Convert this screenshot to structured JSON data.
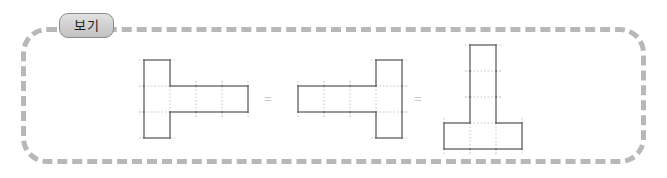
{
  "frame": {
    "border_color": "#b8b8b8",
    "border_style": "dashed",
    "corner_radius_px": 26
  },
  "tag": {
    "label": "보기",
    "fill_color": "#d2d2d2",
    "border_color": "#8c8c8c",
    "text_color": "#1b1b1b"
  },
  "figures": [
    {
      "name": "hexomino-net-left",
      "description": "vertical bar of three squares with horizontal bar of three squares extending right from the middle square",
      "cell_px": 26,
      "outline_color": "#6b6b6b",
      "grid_color": "#c9c9c9",
      "cells": [
        [
          0,
          0
        ],
        [
          0,
          1
        ],
        [
          0,
          2
        ],
        [
          1,
          1
        ],
        [
          2,
          1
        ],
        [
          3,
          1
        ]
      ],
      "cols": 4,
      "rows": 3
    },
    {
      "name": "hexomino-net-middle",
      "description": "horizontal bar of three squares with vertical bar of three squares on the right end, mirrored form",
      "cell_px": 26,
      "outline_color": "#6b6b6b",
      "grid_color": "#c9c9c9",
      "cells": [
        [
          0,
          1
        ],
        [
          1,
          1
        ],
        [
          2,
          1
        ],
        [
          3,
          0
        ],
        [
          3,
          1
        ],
        [
          3,
          2
        ]
      ],
      "cols": 4,
      "rows": 3
    },
    {
      "name": "hexomino-net-right",
      "description": "vertical bar of three squares on top with horizontal bar of three squares at the bottom, rotated form",
      "cell_px": 26,
      "outline_color": "#6b6b6b",
      "grid_color": "#c9c9c9",
      "cells": [
        [
          1,
          0
        ],
        [
          1,
          1
        ],
        [
          1,
          2
        ],
        [
          0,
          3
        ],
        [
          1,
          3
        ],
        [
          2,
          3
        ]
      ],
      "cols": 3,
      "rows": 4
    }
  ],
  "operators": [
    {
      "name": "equals-sign-1",
      "symbol": "=",
      "color": "#c9c9c9"
    },
    {
      "name": "equals-sign-2",
      "symbol": "=",
      "color": "#c9c9c9"
    }
  ]
}
